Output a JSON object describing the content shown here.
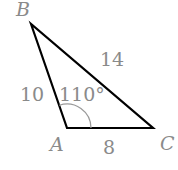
{
  "diagram": {
    "type": "triangle",
    "vertices": [
      {
        "name": "B",
        "label": "B"
      },
      {
        "name": "A",
        "label": "A"
      },
      {
        "name": "C",
        "label": "C"
      }
    ],
    "sides": {
      "AB": "10",
      "BC": "14",
      "AC": "8"
    },
    "angle_A": "110°",
    "colors": {
      "line": "#000000",
      "label": "#8a8a8a",
      "arc": "#9a9a9a"
    }
  }
}
